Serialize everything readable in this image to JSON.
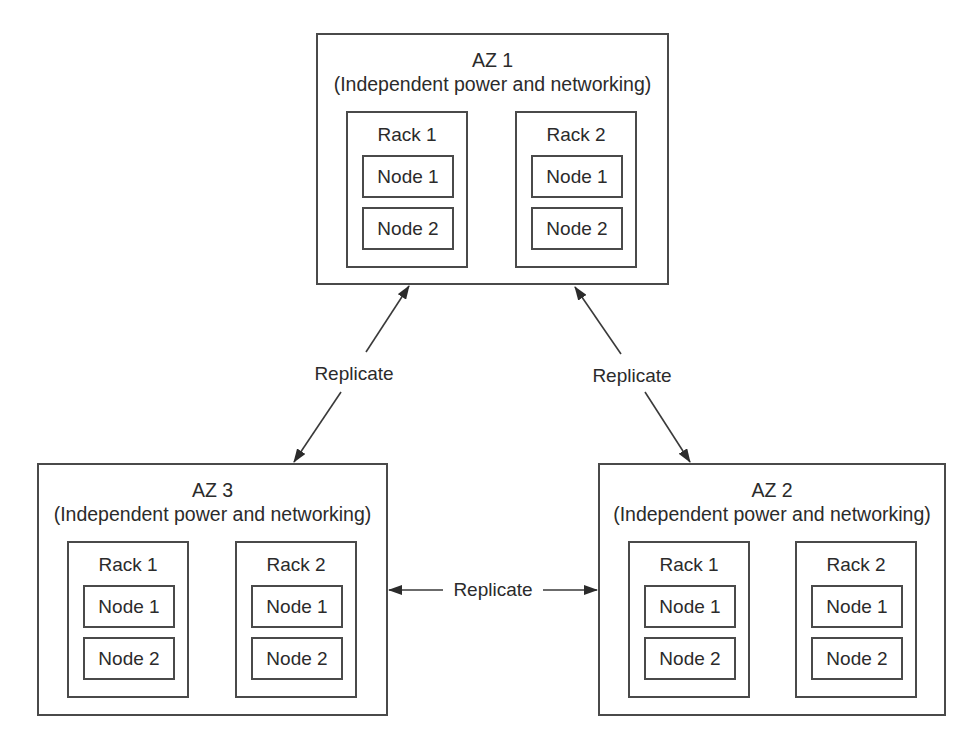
{
  "diagram": {
    "zones": [
      {
        "id": "az1",
        "name": "AZ 1",
        "subtitle": "(Independent power and networking)",
        "racks": [
          {
            "name": "Rack 1",
            "nodes": [
              "Node 1",
              "Node 2"
            ]
          },
          {
            "name": "Rack 2",
            "nodes": [
              "Node 1",
              "Node 2"
            ]
          }
        ]
      },
      {
        "id": "az2",
        "name": "AZ 2",
        "subtitle": "(Independent power and networking)",
        "racks": [
          {
            "name": "Rack 1",
            "nodes": [
              "Node 1",
              "Node 2"
            ]
          },
          {
            "name": "Rack 2",
            "nodes": [
              "Node 1",
              "Node 2"
            ]
          }
        ]
      },
      {
        "id": "az3",
        "name": "AZ 3",
        "subtitle": "(Independent power and networking)",
        "racks": [
          {
            "name": "Rack 1",
            "nodes": [
              "Node 1",
              "Node 2"
            ]
          },
          {
            "name": "Rack 2",
            "nodes": [
              "Node 1",
              "Node 2"
            ]
          }
        ]
      }
    ],
    "connections": [
      {
        "from": "AZ 1",
        "to": "AZ 3",
        "label": "Replicate",
        "bidirectional": true
      },
      {
        "from": "AZ 1",
        "to": "AZ 2",
        "label": "Replicate",
        "bidirectional": true
      },
      {
        "from": "AZ 3",
        "to": "AZ 2",
        "label": "Replicate",
        "bidirectional": true
      }
    ]
  },
  "colors": {
    "line": "#4a4a4a",
    "text": "#2b2b2b",
    "background": "#ffffff"
  }
}
